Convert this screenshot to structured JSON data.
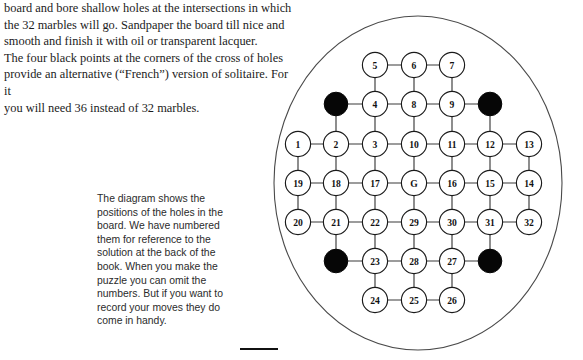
{
  "document": {
    "intro_paragraph": "board and bore shallow holes at the intersections in which\nthe 32 marbles will go. Sandpaper the board till nice and\nsmooth and finish it with oil or transparent lacquer.\nThe four black points at the corners of the cross of holes\nprovide an alternative (“French”) version of solitaire. For it\nyou will need 36 instead of 32 marbles.",
    "caption_paragraph": "The diagram shows the\npositions of the holes in the\nboard. We have numbered\nthem for reference to the\nsolution at the back of the\nbook. When you make the\npuzzle you can omit the\nnumbers. But if you want to\nrecord your moves they do\ncome in handy."
  },
  "colors": {
    "ink": "#1b1b1b",
    "caption_ink": "#2b2b2b",
    "hole_fill": "#ffffff",
    "hole_stroke": "#1a1a1a",
    "french_hole_fill": "#060606",
    "edge_stroke": "#3a3a3a",
    "board_outline": "#4a4a4a",
    "page_background": "#ffffff"
  },
  "diagram": {
    "type": "solitaire-board-hole-map",
    "board_shape": "ellipse",
    "board": {
      "cx": 156,
      "cy": 175,
      "rx": 144,
      "ry": 167
    },
    "grid": {
      "columns_x": [
        36,
        74,
        113,
        152,
        190,
        228,
        267
      ],
      "rows_y": [
        57,
        96,
        136,
        175,
        214,
        253,
        292
      ],
      "hole_radius": 12.6,
      "french_radius": 11.8
    },
    "holes": [
      {
        "id": "n5",
        "label": "5",
        "col": 2,
        "row": 0,
        "kind": "numbered"
      },
      {
        "id": "n6",
        "label": "6",
        "col": 3,
        "row": 0,
        "kind": "numbered"
      },
      {
        "id": "n7",
        "label": "7",
        "col": 4,
        "row": 0,
        "kind": "numbered"
      },
      {
        "id": "fTL",
        "label": "",
        "col": 1,
        "row": 1,
        "kind": "french"
      },
      {
        "id": "n4",
        "label": "4",
        "col": 2,
        "row": 1,
        "kind": "numbered"
      },
      {
        "id": "n8",
        "label": "8",
        "col": 3,
        "row": 1,
        "kind": "numbered"
      },
      {
        "id": "n9",
        "label": "9",
        "col": 4,
        "row": 1,
        "kind": "numbered"
      },
      {
        "id": "fTR",
        "label": "",
        "col": 5,
        "row": 1,
        "kind": "french"
      },
      {
        "id": "n1",
        "label": "1",
        "col": 0,
        "row": 2,
        "kind": "numbered"
      },
      {
        "id": "n2",
        "label": "2",
        "col": 1,
        "row": 2,
        "kind": "numbered"
      },
      {
        "id": "n3",
        "label": "3",
        "col": 2,
        "row": 2,
        "kind": "numbered"
      },
      {
        "id": "n10",
        "label": "10",
        "col": 3,
        "row": 2,
        "kind": "numbered"
      },
      {
        "id": "n11",
        "label": "11",
        "col": 4,
        "row": 2,
        "kind": "numbered"
      },
      {
        "id": "n12",
        "label": "12",
        "col": 5,
        "row": 2,
        "kind": "numbered"
      },
      {
        "id": "n13",
        "label": "13",
        "col": 6,
        "row": 2,
        "kind": "numbered"
      },
      {
        "id": "n19",
        "label": "19",
        "col": 0,
        "row": 3,
        "kind": "numbered"
      },
      {
        "id": "n18",
        "label": "18",
        "col": 1,
        "row": 3,
        "kind": "numbered"
      },
      {
        "id": "n17",
        "label": "17",
        "col": 2,
        "row": 3,
        "kind": "numbered"
      },
      {
        "id": "nG",
        "label": "G",
        "col": 3,
        "row": 3,
        "kind": "numbered"
      },
      {
        "id": "n16",
        "label": "16",
        "col": 4,
        "row": 3,
        "kind": "numbered"
      },
      {
        "id": "n15",
        "label": "15",
        "col": 5,
        "row": 3,
        "kind": "numbered"
      },
      {
        "id": "n14",
        "label": "14",
        "col": 6,
        "row": 3,
        "kind": "numbered"
      },
      {
        "id": "n20",
        "label": "20",
        "col": 0,
        "row": 4,
        "kind": "numbered"
      },
      {
        "id": "n21",
        "label": "21",
        "col": 1,
        "row": 4,
        "kind": "numbered"
      },
      {
        "id": "n22",
        "label": "22",
        "col": 2,
        "row": 4,
        "kind": "numbered"
      },
      {
        "id": "n29",
        "label": "29",
        "col": 3,
        "row": 4,
        "kind": "numbered"
      },
      {
        "id": "n30",
        "label": "30",
        "col": 4,
        "row": 4,
        "kind": "numbered"
      },
      {
        "id": "n31",
        "label": "31",
        "col": 5,
        "row": 4,
        "kind": "numbered"
      },
      {
        "id": "n32",
        "label": "32",
        "col": 6,
        "row": 4,
        "kind": "numbered"
      },
      {
        "id": "fBL",
        "label": "",
        "col": 1,
        "row": 5,
        "kind": "french"
      },
      {
        "id": "n23",
        "label": "23",
        "col": 2,
        "row": 5,
        "kind": "numbered"
      },
      {
        "id": "n28",
        "label": "28",
        "col": 3,
        "row": 5,
        "kind": "numbered"
      },
      {
        "id": "n27",
        "label": "27",
        "col": 4,
        "row": 5,
        "kind": "numbered"
      },
      {
        "id": "fBR",
        "label": "",
        "col": 5,
        "row": 5,
        "kind": "french"
      },
      {
        "id": "n24",
        "label": "24",
        "col": 2,
        "row": 6,
        "kind": "numbered"
      },
      {
        "id": "n25",
        "label": "25",
        "col": 3,
        "row": 6,
        "kind": "numbered"
      },
      {
        "id": "n26",
        "label": "26",
        "col": 4,
        "row": 6,
        "kind": "numbered"
      }
    ],
    "edges": [
      [
        "n5",
        "n6"
      ],
      [
        "n6",
        "n7"
      ],
      [
        "n5",
        "n4"
      ],
      [
        "n6",
        "n8"
      ],
      [
        "n7",
        "n9"
      ],
      [
        "fTL",
        "n4"
      ],
      [
        "n4",
        "n8"
      ],
      [
        "n8",
        "n9"
      ],
      [
        "n9",
        "fTR"
      ],
      [
        "fTL",
        "n2"
      ],
      [
        "n4",
        "n3"
      ],
      [
        "n8",
        "n10"
      ],
      [
        "n9",
        "n11"
      ],
      [
        "fTR",
        "n12"
      ],
      [
        "n1",
        "n2"
      ],
      [
        "n2",
        "n3"
      ],
      [
        "n3",
        "n10"
      ],
      [
        "n10",
        "n11"
      ],
      [
        "n11",
        "n12"
      ],
      [
        "n12",
        "n13"
      ],
      [
        "n1",
        "n19"
      ],
      [
        "n2",
        "n18"
      ],
      [
        "n3",
        "n17"
      ],
      [
        "n10",
        "nG"
      ],
      [
        "n11",
        "n16"
      ],
      [
        "n12",
        "n15"
      ],
      [
        "n13",
        "n14"
      ],
      [
        "n19",
        "n18"
      ],
      [
        "n18",
        "n17"
      ],
      [
        "n17",
        "nG"
      ],
      [
        "nG",
        "n16"
      ],
      [
        "n16",
        "n15"
      ],
      [
        "n15",
        "n14"
      ],
      [
        "n19",
        "n20"
      ],
      [
        "n18",
        "n21"
      ],
      [
        "n17",
        "n22"
      ],
      [
        "nG",
        "n29"
      ],
      [
        "n16",
        "n30"
      ],
      [
        "n15",
        "n31"
      ],
      [
        "n14",
        "n32"
      ],
      [
        "n20",
        "n21"
      ],
      [
        "n21",
        "n22"
      ],
      [
        "n22",
        "n29"
      ],
      [
        "n29",
        "n30"
      ],
      [
        "n30",
        "n31"
      ],
      [
        "n31",
        "n32"
      ],
      [
        "n21",
        "fBL"
      ],
      [
        "n22",
        "n23"
      ],
      [
        "n29",
        "n28"
      ],
      [
        "n30",
        "n27"
      ],
      [
        "n31",
        "fBR"
      ],
      [
        "fBL",
        "n23"
      ],
      [
        "n23",
        "n28"
      ],
      [
        "n28",
        "n27"
      ],
      [
        "n27",
        "fBR"
      ],
      [
        "n23",
        "n24"
      ],
      [
        "n28",
        "n25"
      ],
      [
        "n27",
        "n26"
      ],
      [
        "n24",
        "n25"
      ],
      [
        "n25",
        "n26"
      ]
    ]
  }
}
